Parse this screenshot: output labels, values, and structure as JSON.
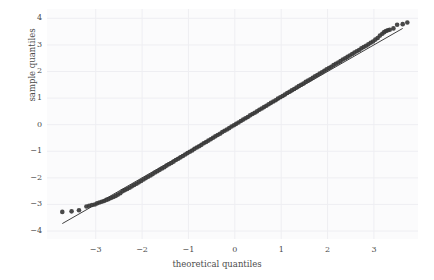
{
  "chart_data": {
    "type": "scatter",
    "title": "",
    "xlabel": "theoretical quantiles",
    "ylabel": "sample quantiles",
    "xlim": [
      -4.05,
      3.95
    ],
    "ylim": [
      -4.3,
      4.35
    ],
    "xticks": [
      -3,
      -2,
      -1,
      0,
      1,
      2,
      3
    ],
    "xtick_labels": [
      "−3",
      "−2",
      "−1",
      "0",
      "1",
      "2",
      "3"
    ],
    "yticks": [
      -4,
      -3,
      -2,
      -1,
      0,
      1,
      2,
      3,
      4
    ],
    "ytick_labels": [
      "−4",
      "−3",
      "−2",
      "−1",
      "0",
      "1",
      "2",
      "3",
      "4"
    ],
    "grid": true,
    "legend": null,
    "marker_color": "#3a3a3a",
    "line_color": "#2a2a2a",
    "background_color": "#fbfbfc",
    "grid_color": "#eeeef2",
    "reference_line": {
      "label": "45-degree reference line",
      "slope": 1.0,
      "intercept": 0.0,
      "x_start": -3.72,
      "y_start": -3.72,
      "x_end": 3.62,
      "y_end": 3.62
    },
    "series": [
      {
        "name": "sample vs theoretical quantiles",
        "points": [
          [
            -3.72,
            -3.28
          ],
          [
            -3.52,
            -3.26
          ],
          [
            -3.36,
            -3.22
          ],
          [
            -3.2,
            -3.08
          ],
          [
            -3.14,
            -3.05
          ],
          [
            -3.08,
            -3.02
          ],
          [
            -3.02,
            -3.0
          ],
          [
            -2.97,
            -2.96
          ],
          [
            -2.92,
            -2.93
          ],
          [
            -2.87,
            -2.9
          ],
          [
            -2.82,
            -2.87
          ],
          [
            -2.77,
            -2.83
          ],
          [
            -2.72,
            -2.8
          ],
          [
            -2.67,
            -2.76
          ],
          [
            -2.62,
            -2.72
          ],
          [
            -2.57,
            -2.68
          ],
          [
            -2.52,
            -2.63
          ],
          [
            -2.47,
            -2.58
          ],
          [
            -2.42,
            -2.5
          ],
          [
            -2.37,
            -2.46
          ],
          [
            -2.32,
            -2.42
          ],
          [
            -2.27,
            -2.37
          ],
          [
            -2.22,
            -2.32
          ],
          [
            -2.17,
            -2.27
          ],
          [
            -2.12,
            -2.22
          ],
          [
            -2.07,
            -2.17
          ],
          [
            -2.02,
            -2.12
          ],
          [
            -1.97,
            -2.06
          ],
          [
            -1.92,
            -2.01
          ],
          [
            -1.87,
            -1.96
          ],
          [
            -1.82,
            -1.91
          ],
          [
            -1.77,
            -1.86
          ],
          [
            -1.72,
            -1.8
          ],
          [
            -1.67,
            -1.75
          ],
          [
            -1.62,
            -1.7
          ],
          [
            -1.57,
            -1.65
          ],
          [
            -1.52,
            -1.6
          ],
          [
            -1.47,
            -1.54
          ],
          [
            -1.42,
            -1.49
          ],
          [
            -1.37,
            -1.44
          ],
          [
            -1.32,
            -1.39
          ],
          [
            -1.27,
            -1.33
          ],
          [
            -1.22,
            -1.28
          ],
          [
            -1.17,
            -1.23
          ],
          [
            -1.12,
            -1.18
          ],
          [
            -1.07,
            -1.12
          ],
          [
            -1.02,
            -1.07
          ],
          [
            -0.97,
            -1.02
          ],
          [
            -0.92,
            -0.97
          ],
          [
            -0.87,
            -0.91
          ],
          [
            -0.82,
            -0.86
          ],
          [
            -0.77,
            -0.81
          ],
          [
            -0.72,
            -0.76
          ],
          [
            -0.67,
            -0.7
          ],
          [
            -0.62,
            -0.65
          ],
          [
            -0.57,
            -0.6
          ],
          [
            -0.52,
            -0.55
          ],
          [
            -0.47,
            -0.49
          ],
          [
            -0.42,
            -0.44
          ],
          [
            -0.37,
            -0.39
          ],
          [
            -0.32,
            -0.34
          ],
          [
            -0.27,
            -0.28
          ],
          [
            -0.22,
            -0.23
          ],
          [
            -0.17,
            -0.18
          ],
          [
            -0.12,
            -0.13
          ],
          [
            -0.07,
            -0.07
          ],
          [
            -0.02,
            -0.02
          ],
          [
            0.03,
            0.03
          ],
          [
            0.08,
            0.08
          ],
          [
            0.13,
            0.14
          ],
          [
            0.18,
            0.19
          ],
          [
            0.23,
            0.24
          ],
          [
            0.28,
            0.29
          ],
          [
            0.33,
            0.35
          ],
          [
            0.38,
            0.4
          ],
          [
            0.43,
            0.45
          ],
          [
            0.48,
            0.5
          ],
          [
            0.53,
            0.56
          ],
          [
            0.58,
            0.61
          ],
          [
            0.63,
            0.66
          ],
          [
            0.68,
            0.71
          ],
          [
            0.73,
            0.77
          ],
          [
            0.78,
            0.82
          ],
          [
            0.83,
            0.87
          ],
          [
            0.88,
            0.92
          ],
          [
            0.93,
            0.98
          ],
          [
            0.98,
            1.03
          ],
          [
            1.03,
            1.08
          ],
          [
            1.08,
            1.13
          ],
          [
            1.13,
            1.19
          ],
          [
            1.18,
            1.24
          ],
          [
            1.23,
            1.29
          ],
          [
            1.28,
            1.34
          ],
          [
            1.33,
            1.4
          ],
          [
            1.38,
            1.45
          ],
          [
            1.43,
            1.5
          ],
          [
            1.48,
            1.55
          ],
          [
            1.53,
            1.61
          ],
          [
            1.58,
            1.66
          ],
          [
            1.63,
            1.71
          ],
          [
            1.68,
            1.76
          ],
          [
            1.73,
            1.82
          ],
          [
            1.78,
            1.87
          ],
          [
            1.83,
            1.92
          ],
          [
            1.88,
            1.97
          ],
          [
            1.93,
            2.03
          ],
          [
            1.98,
            2.08
          ],
          [
            2.03,
            2.13
          ],
          [
            2.08,
            2.18
          ],
          [
            2.13,
            2.24
          ],
          [
            2.18,
            2.29
          ],
          [
            2.23,
            2.34
          ],
          [
            2.28,
            2.39
          ],
          [
            2.33,
            2.45
          ],
          [
            2.38,
            2.5
          ],
          [
            2.43,
            2.55
          ],
          [
            2.48,
            2.6
          ],
          [
            2.53,
            2.66
          ],
          [
            2.58,
            2.71
          ],
          [
            2.63,
            2.76
          ],
          [
            2.68,
            2.81
          ],
          [
            2.73,
            2.87
          ],
          [
            2.78,
            2.92
          ],
          [
            2.83,
            2.97
          ],
          [
            2.88,
            3.02
          ],
          [
            2.93,
            3.08
          ],
          [
            2.98,
            3.13
          ],
          [
            3.03,
            3.2
          ],
          [
            3.08,
            3.26
          ],
          [
            3.13,
            3.35
          ],
          [
            3.18,
            3.42
          ],
          [
            3.22,
            3.48
          ],
          [
            3.26,
            3.52
          ],
          [
            3.3,
            3.55
          ],
          [
            3.34,
            3.57
          ],
          [
            3.42,
            3.62
          ],
          [
            3.5,
            3.76
          ],
          [
            3.62,
            3.78
          ],
          [
            3.72,
            3.84
          ]
        ]
      }
    ]
  }
}
